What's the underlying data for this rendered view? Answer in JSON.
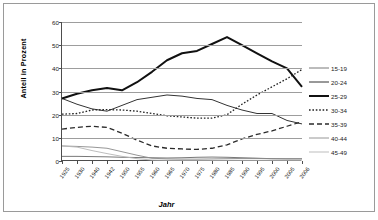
{
  "chart_data": {
    "type": "line",
    "title": "",
    "xlabel": "Jahr",
    "ylabel": "Anteil in Prozent",
    "ylim": [
      0,
      60
    ],
    "yticks": [
      0,
      10,
      20,
      30,
      40,
      50,
      60
    ],
    "grid": true,
    "legend_position": "right",
    "categories": [
      "1925",
      "1930",
      "1940",
      "1942",
      "1950",
      "1955",
      "1960",
      "1965",
      "1970",
      "1975",
      "1980",
      "1985",
      "1990",
      "1995",
      "2000",
      "2005",
      "2006"
    ],
    "series": [
      {
        "name": "15-19",
        "style": "solid-thin",
        "color": "#555555",
        "values": [
          2.0,
          2.0,
          1.9,
          1.8,
          1.6,
          1.5,
          1.4,
          1.3,
          1.4,
          1.6,
          1.7,
          1.6,
          1.4,
          1.2,
          1.0,
          0.9,
          0.9
        ]
      },
      {
        "name": "20-24",
        "style": "solid-medium",
        "color": "#333333",
        "values": [
          27.0,
          24.5,
          22.5,
          21.5,
          24.0,
          26.5,
          27.5,
          28.5,
          28.0,
          27.0,
          26.5,
          24.0,
          22.0,
          20.5,
          20.5,
          17.5,
          16.0
        ]
      },
      {
        "name": "25-29",
        "style": "solid-bold",
        "color": "#111111",
        "values": [
          27.0,
          29.0,
          30.5,
          31.5,
          30.5,
          34.0,
          38.5,
          43.5,
          46.5,
          47.5,
          50.5,
          53.5,
          50.0,
          46.5,
          43.0,
          40.0,
          32.0
        ]
      },
      {
        "name": "30-34",
        "style": "dotted",
        "color": "#222222",
        "values": [
          20.2,
          20.5,
          22.0,
          22.2,
          22.0,
          21.5,
          20.5,
          19.5,
          19.0,
          18.5,
          18.5,
          20.0,
          24.5,
          28.5,
          32.0,
          35.5,
          39.5
        ]
      },
      {
        "name": "35-39",
        "style": "dashed",
        "color": "#2a2a2a",
        "values": [
          13.8,
          14.5,
          15.0,
          14.5,
          12.0,
          9.0,
          6.5,
          5.5,
          5.2,
          5.0,
          5.5,
          7.0,
          9.5,
          11.5,
          13.0,
          15.0,
          17.0
        ]
      },
      {
        "name": "40-44",
        "style": "solid-gray",
        "color": "#8a8a8a",
        "values": [
          6.5,
          6.3,
          6.0,
          5.5,
          4.0,
          2.5,
          1.2,
          0.9,
          0.8,
          0.8,
          0.9,
          1.0,
          1.1,
          1.1,
          1.0,
          1.0,
          1.0
        ]
      },
      {
        "name": "45-49",
        "style": "solid-lightgray",
        "color": "#b5b5b5",
        "values": [
          6.5,
          6.0,
          4.5,
          3.2,
          2.0,
          1.0,
          0.4,
          0.3,
          0.3,
          0.3,
          0.3,
          0.3,
          0.3,
          0.3,
          0.3,
          0.3,
          0.3
        ]
      }
    ]
  }
}
